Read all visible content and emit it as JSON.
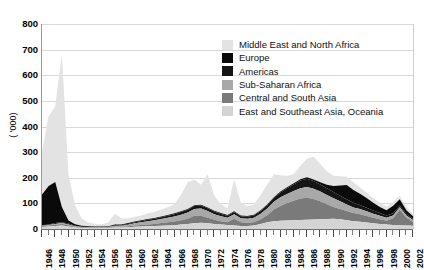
{
  "chart_data": {
    "type": "area",
    "stacked": true,
    "title": "",
    "xlabel": "",
    "ylabel": "( '000)",
    "ylim": [
      0,
      800
    ],
    "ytick_values": [
      0,
      100,
      200,
      300,
      400,
      500,
      600,
      700,
      800
    ],
    "ytick_labels": [
      "0",
      "100",
      "200",
      "300",
      "400",
      "500",
      "600",
      "700",
      "800"
    ],
    "xlim": [
      1946,
      2002
    ],
    "grid": true,
    "legend_position": "upper-right-inside",
    "x": [
      1946,
      1947,
      1948,
      1949,
      1950,
      1951,
      1952,
      1953,
      1954,
      1955,
      1956,
      1957,
      1958,
      1959,
      1960,
      1961,
      1962,
      1963,
      1964,
      1965,
      1966,
      1967,
      1968,
      1969,
      1970,
      1971,
      1972,
      1973,
      1974,
      1975,
      1976,
      1977,
      1978,
      1979,
      1980,
      1981,
      1982,
      1983,
      1984,
      1985,
      1986,
      1987,
      1988,
      1989,
      1990,
      1991,
      1992,
      1993,
      1994,
      1995,
      1996,
      1997,
      1998,
      1999,
      2000,
      2001,
      2002
    ],
    "xtick_labels": [
      "1946",
      "1948",
      "1950",
      "1952",
      "1954",
      "1956",
      "1958",
      "1960",
      "1962",
      "1964",
      "1966",
      "1968",
      "1970",
      "1972",
      "1974",
      "1976",
      "1978",
      "1980",
      "1982",
      "1984",
      "1986",
      "1988",
      "1990",
      "1992",
      "1994",
      "1996",
      "1998",
      "2000",
      "2002"
    ],
    "series": [
      {
        "name": "East and Southeast Asia, Oceania",
        "color": "#d4d4d4",
        "values": [
          8,
          10,
          12,
          14,
          10,
          6,
          4,
          3,
          3,
          3,
          4,
          6,
          6,
          7,
          9,
          10,
          11,
          12,
          13,
          14,
          15,
          18,
          20,
          22,
          24,
          22,
          20,
          18,
          16,
          14,
          12,
          12,
          14,
          20,
          26,
          30,
          32,
          33,
          34,
          35,
          36,
          37,
          38,
          39,
          40,
          38,
          34,
          30,
          28,
          25,
          22,
          20,
          18,
          16,
          15,
          14,
          13
        ]
      },
      {
        "name": "Central and South Asia",
        "color": "#7a7a7a",
        "values": [
          3,
          4,
          5,
          6,
          5,
          3,
          2,
          2,
          2,
          2,
          2,
          3,
          3,
          4,
          5,
          6,
          7,
          8,
          10,
          12,
          14,
          16,
          20,
          30,
          28,
          22,
          16,
          12,
          10,
          26,
          14,
          12,
          12,
          18,
          28,
          46,
          58,
          68,
          76,
          84,
          86,
          80,
          70,
          58,
          46,
          40,
          36,
          32,
          30,
          26,
          22,
          18,
          14,
          26,
          60,
          30,
          14
        ]
      },
      {
        "name": "Sub-Saharan Africa",
        "color": "#a8a8a8",
        "values": [
          2,
          2,
          3,
          3,
          3,
          2,
          2,
          2,
          2,
          2,
          2,
          3,
          4,
          6,
          8,
          10,
          12,
          14,
          16,
          18,
          20,
          22,
          24,
          26,
          28,
          26,
          22,
          20,
          18,
          18,
          16,
          16,
          18,
          22,
          26,
          30,
          34,
          36,
          38,
          40,
          42,
          40,
          38,
          36,
          34,
          30,
          26,
          22,
          20,
          18,
          16,
          14,
          12,
          11,
          10,
          9,
          8
        ]
      },
      {
        "name": "Americas",
        "color": "#151515",
        "values": [
          2,
          2,
          3,
          3,
          3,
          2,
          1,
          1,
          1,
          1,
          1,
          2,
          2,
          3,
          4,
          5,
          6,
          6,
          7,
          8,
          9,
          10,
          11,
          12,
          12,
          11,
          10,
          9,
          8,
          8,
          8,
          8,
          9,
          10,
          12,
          14,
          18,
          22,
          26,
          30,
          32,
          30,
          28,
          26,
          24,
          22,
          20,
          18,
          16,
          14,
          12,
          10,
          9,
          8,
          7,
          6,
          5
        ]
      },
      {
        "name": "Europe",
        "color": "#0a0a0a",
        "values": [
          120,
          150,
          160,
          60,
          12,
          6,
          4,
          3,
          2,
          2,
          2,
          4,
          3,
          3,
          3,
          3,
          3,
          3,
          3,
          3,
          3,
          3,
          3,
          3,
          3,
          3,
          3,
          3,
          3,
          3,
          3,
          3,
          3,
          3,
          4,
          4,
          4,
          4,
          5,
          5,
          6,
          6,
          8,
          14,
          24,
          40,
          56,
          50,
          44,
          38,
          30,
          24,
          20,
          30,
          24,
          14,
          10
        ]
      },
      {
        "name": "Middle East and North Africa",
        "color": "#e3e3e3",
        "values": [
          165,
          272,
          297,
          597,
          180,
          72,
          28,
          14,
          10,
          9,
          14,
          42,
          24,
          19,
          19,
          19,
          22,
          24,
          27,
          30,
          36,
          66,
          104,
          100,
          78,
          130,
          60,
          34,
          26,
          126,
          50,
          38,
          40,
          60,
          78,
          90,
          64,
          44,
          36,
          52,
          72,
          90,
          72,
          52,
          40,
          36,
          32,
          30,
          24,
          20,
          18,
          16,
          14,
          14,
          14,
          12,
          10
        ]
      }
    ],
    "legend_order": [
      "Middle East and North Africa",
      "Europe",
      "Americas",
      "Sub-Saharan Africa",
      "Central and South Asia",
      "East and Southeast Asia, Oceania"
    ],
    "legend_colors": {
      "Middle East and North Africa": "#e3e3e3",
      "Europe": "#0a0a0a",
      "Americas": "#151515",
      "Sub-Saharan Africa": "#a8a8a8",
      "Central and South Asia": "#7a7a7a",
      "East and Southeast Asia, Oceania": "#d4d4d4"
    }
  }
}
